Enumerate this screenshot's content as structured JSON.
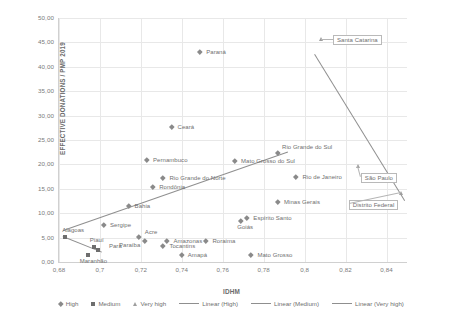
{
  "chart_data": {
    "type": "scatter",
    "title": "",
    "xlabel": "IDHM",
    "ylabel": "EFFECTIVE DONATIONS / PMP 2019",
    "xlim": [
      0.68,
      0.85
    ],
    "ylim": [
      0.0,
      50.0
    ],
    "xticks": [
      "0,68",
      "0,7",
      "0,72",
      "0,74",
      "0,76",
      "0,78",
      "0,8",
      "0,82",
      "0,84"
    ],
    "xtick_values": [
      0.68,
      0.7,
      0.72,
      0.74,
      0.76,
      0.78,
      0.8,
      0.82,
      0.84
    ],
    "yticks": [
      "0,00",
      "5,00",
      "10,00",
      "15,00",
      "20,00",
      "25,00",
      "30,00",
      "35,00",
      "40,00",
      "45,00",
      "50,00"
    ],
    "ytick_values": [
      0,
      5,
      10,
      15,
      20,
      25,
      30,
      35,
      40,
      45,
      50
    ],
    "grid": true,
    "legend_position": "bottom",
    "series": [
      {
        "name": "High",
        "marker": "diamond",
        "color": "#8a8a8a",
        "points": [
          {
            "label": "Ceará",
            "x": 0.735,
            "y": 27.6,
            "lx": 6,
            "ly": -3
          },
          {
            "label": "Pernambuco",
            "x": 0.723,
            "y": 20.9,
            "lx": 6,
            "ly": -3
          },
          {
            "label": "Rio Grande do Norte",
            "x": 0.731,
            "y": 17.2,
            "lx": 6,
            "ly": -3
          },
          {
            "label": "Rondônia",
            "x": 0.726,
            "y": 15.3,
            "lx": 6,
            "ly": -3
          },
          {
            "label": "Bahia",
            "x": 0.714,
            "y": 11.4,
            "lx": 6,
            "ly": -3
          },
          {
            "label": "Sergipe",
            "x": 0.702,
            "y": 7.5,
            "lx": 6,
            "ly": -3
          },
          {
            "label": "Acre",
            "x": 0.719,
            "y": 5.2,
            "lx": 6,
            "ly": -8
          },
          {
            "label": "Paraíba",
            "x": 0.722,
            "y": 4.3,
            "lx": -26,
            "ly": 1
          },
          {
            "label": "Amazonas",
            "x": 0.733,
            "y": 4.3,
            "lx": 6,
            "ly": -3
          },
          {
            "label": "Tocantins",
            "x": 0.731,
            "y": 3.2,
            "lx": 6,
            "ly": -3
          },
          {
            "label": "Roraima",
            "x": 0.752,
            "y": 4.3,
            "lx": 6,
            "ly": -3
          },
          {
            "label": "Amapá",
            "x": 0.74,
            "y": 1.4,
            "lx": 6,
            "ly": -3
          },
          {
            "label": "Mato Grosso",
            "x": 0.774,
            "y": 1.5,
            "lx": 6,
            "ly": -3
          },
          {
            "label": "Goiás",
            "x": 0.769,
            "y": 8.5,
            "lx": -4,
            "ly": 3
          },
          {
            "label": "Espírito Santo",
            "x": 0.772,
            "y": 9.0,
            "lx": 6,
            "ly": -3
          },
          {
            "label": "Minas Gerais",
            "x": 0.787,
            "y": 12.3,
            "lx": 6,
            "ly": -3
          },
          {
            "label": "Mato Grosso do Sul",
            "x": 0.766,
            "y": 20.7,
            "lx": 6,
            "ly": -3
          },
          {
            "label": "Rio de Janeiro",
            "x": 0.796,
            "y": 17.5,
            "lx": 6,
            "ly": -3
          },
          {
            "label": "Rio Grande do Sul",
            "x": 0.787,
            "y": 22.4,
            "lx": 4,
            "ly": -9
          },
          {
            "label": "Paraná",
            "x": 0.749,
            "y": 43.0,
            "lx": 6,
            "ly": -3
          }
        ]
      },
      {
        "name": "Medium",
        "marker": "square",
        "color": "#6e6e6e",
        "points": [
          {
            "label": "Alagoas",
            "x": 0.683,
            "y": 5.2,
            "lx": -3,
            "ly": -10
          },
          {
            "label": "Maranhão",
            "x": 0.694,
            "y": 1.4,
            "lx": -8,
            "ly": 3
          },
          {
            "label": "Piauí",
            "x": 0.697,
            "y": 3.0,
            "lx": -4,
            "ly": -10
          },
          {
            "label": "Pará",
            "x": 0.699,
            "y": 2.4,
            "lx": 11,
            "ly": -7
          }
        ]
      },
      {
        "name": "Very high",
        "marker": "triangle",
        "color": "#9e9e9e",
        "points": [
          {
            "label": "Santa Catarina",
            "x": 0.808,
            "y": 45.6,
            "boxed": true,
            "lx": 12,
            "ly": -4
          },
          {
            "label": "São Paulo",
            "x": 0.826,
            "y": 19.6,
            "boxed": true,
            "lx": 3,
            "ly": 7
          },
          {
            "label": "Distrito Federal",
            "x": 0.847,
            "y": 14.2,
            "boxed": true,
            "lx": -52,
            "ly": 7
          }
        ]
      }
    ],
    "trendlines": [
      {
        "name": "Linear (High)",
        "x1": 0.682,
        "y1": 6.5,
        "x2": 0.792,
        "y2": 22.6
      },
      {
        "name": "Linear (Medium)",
        "x1": 0.682,
        "y1": 5.3,
        "x2": 0.701,
        "y2": 2.1
      },
      {
        "name": "Linear (Very high)",
        "x1": 0.805,
        "y1": 42.7,
        "x2": 0.849,
        "y2": 12.7
      }
    ],
    "legend": [
      {
        "label": "High",
        "type": "marker",
        "marker": "diamond"
      },
      {
        "label": "Medium",
        "type": "marker",
        "marker": "square"
      },
      {
        "label": "Very high",
        "type": "marker",
        "marker": "triangle"
      },
      {
        "label": "Linear (High)",
        "type": "line"
      },
      {
        "label": "Linear (Medium)",
        "type": "line"
      },
      {
        "label": "Linear (Very high)",
        "type": "line"
      }
    ]
  }
}
